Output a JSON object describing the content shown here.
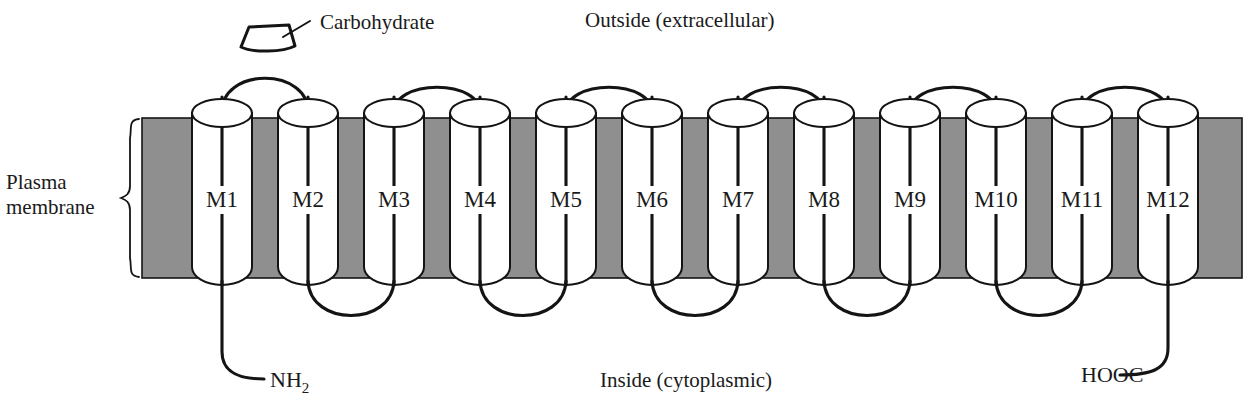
{
  "figure": {
    "labels": {
      "outside": "Outside (extracellular)",
      "inside": "Inside  (cytoplasmic)",
      "plasma_line1": "Plasma",
      "plasma_line2": "membrane",
      "carbohydrate": "Carbohydrate",
      "n_terminus": "NH",
      "n_terminus_sub": "2",
      "c_terminus": "HOOC"
    },
    "colors": {
      "membrane_fill": "#8f8f8f",
      "outline": "#141414",
      "cylinder_fill": "#ffffff",
      "background": "#ffffff",
      "text": "#1a1a1a"
    },
    "helices": [
      {
        "label": "M1",
        "cx": 222,
        "top_loop_partner": "M2",
        "bottom_loop_partner": null
      },
      {
        "label": "M2",
        "cx": 308,
        "top_loop_partner": "M1",
        "bottom_loop_partner": "M3"
      },
      {
        "label": "M3",
        "cx": 394,
        "top_loop_partner": "M4",
        "bottom_loop_partner": "M2"
      },
      {
        "label": "M4",
        "cx": 480,
        "top_loop_partner": "M3",
        "bottom_loop_partner": "M5"
      },
      {
        "label": "M5",
        "cx": 566,
        "top_loop_partner": "M6",
        "bottom_loop_partner": "M4"
      },
      {
        "label": "M6",
        "cx": 652,
        "top_loop_partner": "M5",
        "bottom_loop_partner": "M7"
      },
      {
        "label": "M7",
        "cx": 738,
        "top_loop_partner": "M8",
        "bottom_loop_partner": "M6"
      },
      {
        "label": "M8",
        "cx": 824,
        "top_loop_partner": "M7",
        "bottom_loop_partner": "M9"
      },
      {
        "label": "M9",
        "cx": 910,
        "top_loop_partner": "M10",
        "bottom_loop_partner": "M8"
      },
      {
        "label": "M10",
        "cx": 996,
        "top_loop_partner": "M9",
        "bottom_loop_partner": "M11"
      },
      {
        "label": "M11",
        "cx": 1082,
        "top_loop_partner": "M12",
        "bottom_loop_partner": "M10"
      },
      {
        "label": "M12",
        "cx": 1168,
        "top_loop_partner": "M11",
        "bottom_loop_partner": null
      }
    ],
    "geometry": {
      "membrane_left": 142,
      "membrane_right": 1242,
      "membrane_top": 118,
      "membrane_bottom": 278,
      "cylinder_half_width": 30,
      "ellipse_ry": 14,
      "helix_count": 12
    }
  }
}
